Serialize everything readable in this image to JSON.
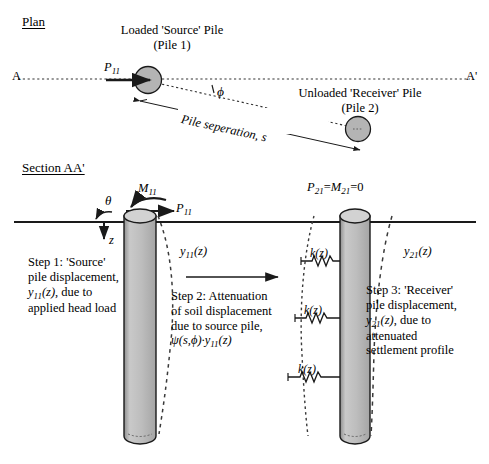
{
  "figure": {
    "title_plan": "Plan",
    "title_section": "Section AA'"
  },
  "plan": {
    "source_pile_label_line1": "Loaded 'Source' Pile",
    "source_pile_label_line2": "(Pile 1)",
    "receiver_pile_label_line1": "Unloaded 'Receiver' Pile",
    "receiver_pile_label_line2": "(Pile 2)",
    "section_line_left": "A",
    "section_line_right": "A'",
    "load_label": "P",
    "load_sub": "11",
    "angle_label": "ϕ",
    "separation_label": "Pile seperation, s"
  },
  "section": {
    "moment_label": "M",
    "moment_sub": "11",
    "force_label": "P",
    "force_sub": "11",
    "theta_label": "θ",
    "depth_label": "z",
    "source_disp_label": "y",
    "source_disp_sub": "11",
    "source_disp_arg": "(z)",
    "receiver_head_label": "P",
    "receiver_head_sub1": "21",
    "receiver_head_eq1": "=",
    "receiver_head_label2": "M",
    "receiver_head_sub2": "21",
    "receiver_head_eq2": "=0",
    "receiver_disp_label": "y",
    "receiver_disp_sub": "21",
    "receiver_disp_arg": "(z)",
    "spring_label": "k(z)",
    "springs": [
      "k(z)",
      "k(z)",
      "k(z)"
    ]
  },
  "steps": {
    "step1": {
      "lines": [
        "Step 1: 'Source'",
        "pile displacement,",
        "y11(z), due to",
        "applied head load"
      ],
      "line1": "Step 1: 'Source'",
      "line2": "pile displacement,",
      "line3_sym": "y",
      "line3_sub": "11",
      "line3_rest": "(z)",
      "line3_tail": ", due to",
      "line4": "applied head load"
    },
    "step2": {
      "line1": "Step 2: Attenuation",
      "line2": "of soil displacement",
      "line3": "due to source pile,",
      "line4_psi": "ψ",
      "line4_args": "(s,ϕ)·",
      "line4_y": "y",
      "line4_sub": "11",
      "line4_arg": "(z)"
    },
    "step3": {
      "line1": "Step 3: 'Receiver'",
      "line2": "pile displacement,",
      "line3_sym": "y",
      "line3_sub": "21",
      "line3_rest": "(z)",
      "line3_tail": ", due to",
      "line4": "attenuated",
      "line5": "settlement profile"
    }
  },
  "colors": {
    "pile_fill": "#b9b9b9",
    "pile_fill_light": "#cccccc",
    "stroke": "#1a1a1a",
    "dash": "#2b2b2b",
    "background": "#ffffff"
  }
}
